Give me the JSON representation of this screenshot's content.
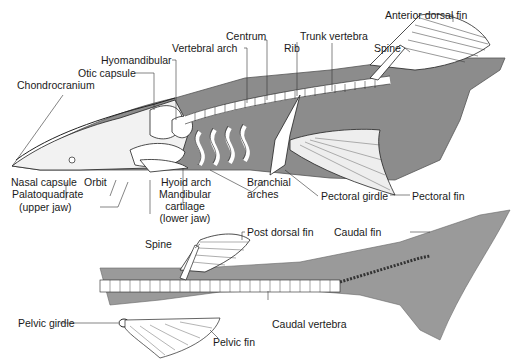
{
  "figure": {
    "colors": {
      "body": "#8c8c8c",
      "body_light": "#b5b5b5",
      "cartilage": "#ffffff",
      "line": "#222222"
    }
  },
  "labels": {
    "anterior_dorsal_fin": "Anterior dorsal fin",
    "centrum": "Centrum",
    "trunk_vertebra": "Trunk vertebra",
    "vertebral_arch": "Vertebral arch",
    "rib": "Rib",
    "spine_top": "Spine",
    "hyomandibular": "Hyomandibular",
    "otic_capsule": "Otic capsule",
    "chondrocranium": "Chondrocranium",
    "nasal_capsule": "Nasal capsule",
    "orbit": "Orbit",
    "palatoquadrate": "Palatoquadrate",
    "upper_jaw": "(upper jaw)",
    "hyoid_arch": "Hyoid arch",
    "mandibular": "Mandibular",
    "cartilage": "cartilage",
    "lower_jaw": "(lower jaw)",
    "branchial": "Branchial",
    "arches": "arches",
    "pectoral_girdle": "Pectoral girdle",
    "pectoral_fin": "Pectoral fin",
    "spine_bottom": "Spine",
    "post_dorsal_fin": "Post dorsal fin",
    "caudal_fin": "Caudal fin",
    "pelvic_girdle": "Pelvic girdle",
    "caudal_vertebra": "Caudal vertebra",
    "pelvic_fin": "Pelvic fin"
  }
}
